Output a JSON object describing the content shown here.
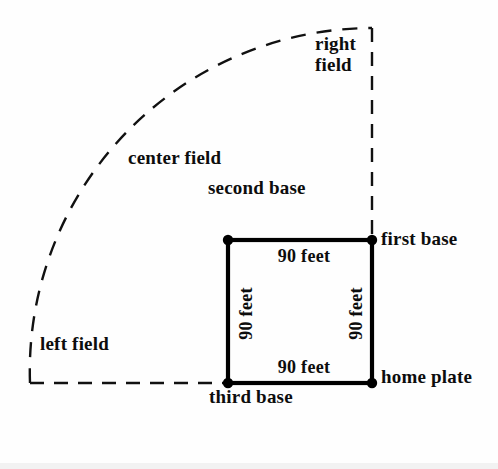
{
  "diagram": {
    "colors": {
      "ink": "#0d0d0d",
      "background": "#fefefe",
      "infield_line": "#000000",
      "fence_line": "#111111"
    },
    "labels": {
      "right_field": "right\nfield",
      "center_field": "center\nfield",
      "left_field": "left\nfield",
      "second_base": "second\nbase",
      "first_base": "first base",
      "third_base": "third\nbase",
      "home_plate": "home\nplate"
    },
    "dimensions": {
      "top": "90 feet",
      "right": "90 feet",
      "bottom": "90 feet",
      "left": "90 feet"
    },
    "geometry": {
      "infield_square": {
        "second_base": [
          228,
          240
        ],
        "first_base": [
          372,
          240
        ],
        "home_plate": [
          372,
          383
        ],
        "third_base": [
          228,
          383
        ],
        "side_length_px": 144,
        "side_length_feet": 90
      },
      "foul_lines": {
        "right_field_line_x": 372,
        "left_field_line_y": 383,
        "right_field_line_top_y": 28,
        "left_field_line_left_x": 30
      },
      "outfield_arc": {
        "center": [
          372,
          383
        ],
        "radius_px": 343,
        "start": [
          30,
          383
        ],
        "end": [
          372,
          28
        ],
        "style": "dashed"
      }
    }
  }
}
